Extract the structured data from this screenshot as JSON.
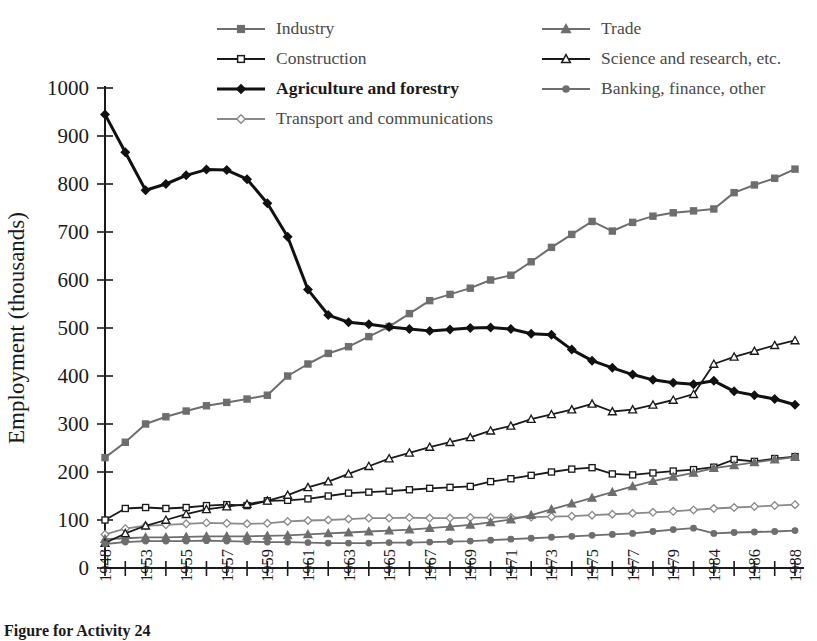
{
  "caption": "Figure for Activity 24",
  "legend": {
    "left_column": [
      {
        "label": "Industry",
        "key": "industry"
      },
      {
        "label": "Construction",
        "key": "construction"
      },
      {
        "label": "Agriculture and forestry",
        "key": "agriculture"
      },
      {
        "label": "Transport and communications",
        "key": "transport"
      }
    ],
    "right_column": [
      {
        "label": "Trade",
        "key": "trade"
      },
      {
        "label": "Science and research, etc.",
        "key": "science"
      },
      {
        "label": "Banking, finance, other",
        "key": "banking"
      }
    ]
  },
  "chart_data": {
    "type": "line",
    "title": "",
    "xlabel": "",
    "ylabel": "Employment  (thousands)",
    "ylim": [
      0,
      1000
    ],
    "ytick_step": 100,
    "yticks": [
      0,
      100,
      200,
      300,
      400,
      500,
      600,
      700,
      800,
      900,
      1000
    ],
    "grid": false,
    "legend_position": "top",
    "x": [
      1948,
      1952,
      1953,
      1954,
      1955,
      1956,
      1957,
      1958,
      1959,
      1960,
      1961,
      1962,
      1963,
      1964,
      1965,
      1966,
      1967,
      1968,
      1969,
      1970,
      1971,
      1972,
      1973,
      1974,
      1975,
      1976,
      1977,
      1978,
      1979,
      1983,
      1984,
      1985,
      1986,
      1987,
      1988
    ],
    "xtick_labels": [
      "1948",
      "",
      "1953",
      "",
      "1955",
      "",
      "1957",
      "",
      "1959",
      "",
      "1961",
      "",
      "1963",
      "",
      "1965",
      "",
      "1967",
      "",
      "1969",
      "",
      "1971",
      "",
      "1973",
      "",
      "1975",
      "",
      "1977",
      "",
      "1979",
      "",
      "1984",
      "",
      "1986",
      "",
      "1988"
    ],
    "series": [
      {
        "name": "Industry",
        "key": "industry",
        "color": "#6e6e6e",
        "marker": "square",
        "marker_fill": "#6e6e6e",
        "line_width": 2,
        "values": [
          230,
          262,
          300,
          315,
          327,
          338,
          345,
          352,
          360,
          400,
          425,
          447,
          461,
          482,
          503,
          530,
          557,
          570,
          583,
          600,
          610,
          638,
          668,
          695,
          722,
          702,
          720,
          733,
          740,
          744,
          748,
          782,
          798,
          812,
          831
        ]
      },
      {
        "name": "Construction",
        "key": "construction",
        "color": "#1a1a1a",
        "marker": "square-open",
        "marker_fill": "#ffffff",
        "line_width": 1.8,
        "values": [
          100,
          124,
          126,
          124,
          126,
          130,
          132,
          130,
          140,
          141,
          144,
          150,
          156,
          158,
          160,
          163,
          166,
          168,
          170,
          180,
          186,
          193,
          200,
          206,
          209,
          196,
          194,
          198,
          202,
          205,
          210,
          226,
          222,
          228,
          232
        ]
      },
      {
        "name": "Agriculture and forestry",
        "key": "agriculture",
        "color": "#111111",
        "marker": "diamond",
        "marker_fill": "#111111",
        "line_width": 3,
        "bold": true,
        "values": [
          945,
          866,
          787,
          800,
          818,
          830,
          829,
          810,
          760,
          690,
          580,
          527,
          512,
          508,
          502,
          498,
          494,
          497,
          500,
          501,
          498,
          488,
          486,
          455,
          432,
          417,
          403,
          392,
          386,
          383,
          390,
          368,
          360,
          352,
          340
        ]
      },
      {
        "name": "Transport and communications",
        "key": "transport",
        "color": "#8a8a8a",
        "marker": "diamond-open",
        "marker_fill": "#ffffff",
        "line_width": 1.8,
        "values": [
          70,
          82,
          88,
          90,
          92,
          94,
          93,
          92,
          93,
          97,
          99,
          100,
          102,
          104,
          104,
          105,
          104,
          104,
          105,
          105,
          105,
          106,
          107,
          108,
          110,
          112,
          114,
          116,
          118,
          121,
          124,
          126,
          128,
          130,
          132
        ]
      },
      {
        "name": "Trade",
        "key": "trade",
        "color": "#6e6e6e",
        "marker": "triangle",
        "marker_fill": "#6e6e6e",
        "line_width": 1.8,
        "values": [
          60,
          62,
          64,
          64,
          65,
          66,
          66,
          66,
          67,
          68,
          70,
          72,
          74,
          76,
          78,
          80,
          83,
          86,
          90,
          95,
          101,
          110,
          122,
          134,
          146,
          158,
          170,
          181,
          190,
          198,
          208,
          214,
          220,
          226,
          231
        ]
      },
      {
        "name": "Science and research, etc.",
        "key": "science",
        "color": "#1a1a1a",
        "marker": "triangle-open",
        "marker_fill": "#ffffff",
        "line_width": 1.8,
        "values": [
          52,
          72,
          88,
          100,
          112,
          122,
          128,
          133,
          140,
          152,
          168,
          180,
          196,
          212,
          228,
          240,
          252,
          262,
          272,
          286,
          296,
          310,
          320,
          330,
          342,
          326,
          330,
          340,
          350,
          362,
          425,
          440,
          452,
          464,
          474
        ]
      },
      {
        "name": "Banking, finance, other",
        "key": "banking",
        "color": "#6e6e6e",
        "marker": "circle",
        "marker_fill": "#6e6e6e",
        "line_width": 1.8,
        "values": [
          50,
          54,
          56,
          56,
          56,
          57,
          56,
          55,
          54,
          54,
          53,
          52,
          52,
          52,
          53,
          53,
          54,
          55,
          56,
          58,
          60,
          62,
          64,
          66,
          68,
          70,
          72,
          76,
          80,
          83,
          72,
          74,
          75,
          76,
          78
        ]
      }
    ]
  }
}
